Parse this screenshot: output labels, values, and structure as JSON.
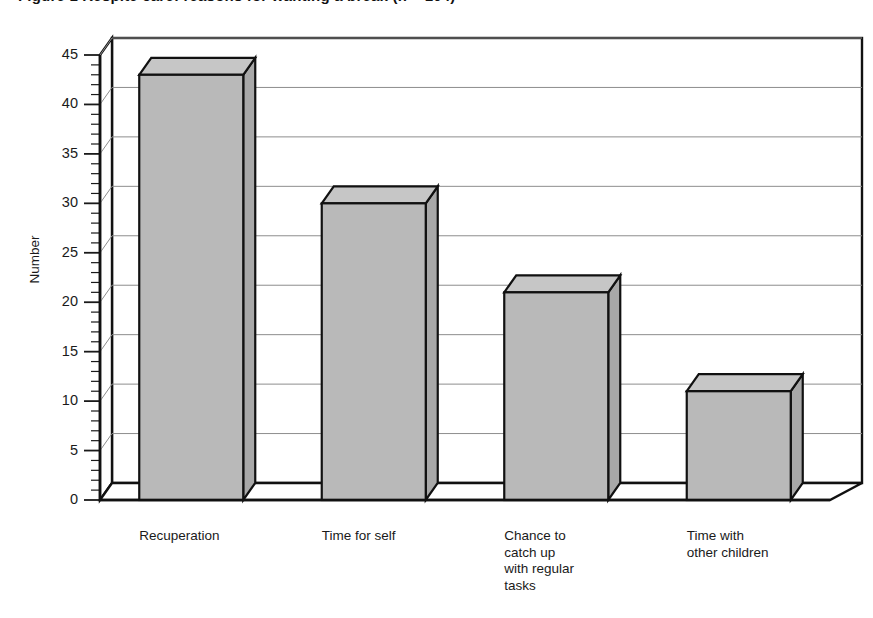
{
  "chart_data": {
    "type": "bar",
    "title": "Figure 1  Respite care: reasons for wanting a break (n = 104)",
    "categories": [
      "Recuperation",
      "Time for self",
      "Chance to\ncatch up\nwith regular\ntasks",
      "Time with\nother children"
    ],
    "values": [
      43,
      30,
      21,
      11
    ],
    "xlabel": "",
    "ylabel": "Number",
    "ylim": [
      0,
      45
    ],
    "ytick_labels": [
      "0",
      "5",
      "10",
      "15",
      "20",
      "25",
      "30",
      "35",
      "40",
      "45"
    ],
    "ytick_values": [
      0,
      5,
      10,
      15,
      20,
      25,
      30,
      35,
      40,
      45
    ],
    "minor_tick_step": 1,
    "grid": "horizontal",
    "legend": "none",
    "style": "3d-bar",
    "bar_color": "#b9b9b9",
    "bar_top_color": "#c6c6c6",
    "bar_side_color": "#a8a8a8",
    "outline_color": "#111111",
    "gridline_color": "#8d8d8d",
    "background": "#ffffff"
  }
}
